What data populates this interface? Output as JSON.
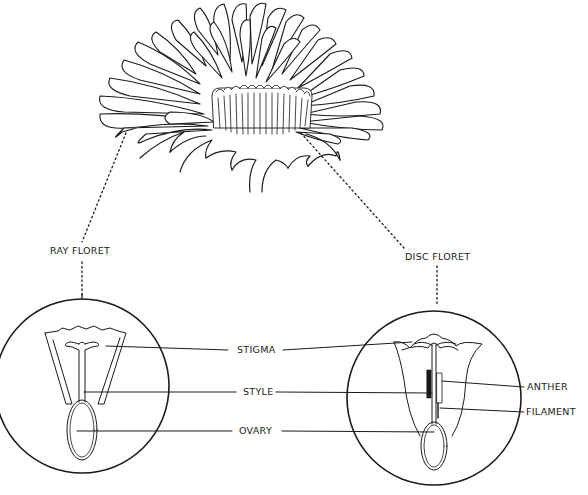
{
  "diagram": {
    "colors": {
      "ink": "#1a1a1a",
      "background": "#ffffff"
    },
    "callouts": {
      "ray_floret": "RAY FLORET",
      "disc_floret": "DISC FLORET"
    },
    "parts": {
      "stigma": "STIGMA",
      "style": "STYLE",
      "ovary": "OVARY",
      "anther": "ANTHER",
      "filament": "FILAMENT"
    }
  }
}
